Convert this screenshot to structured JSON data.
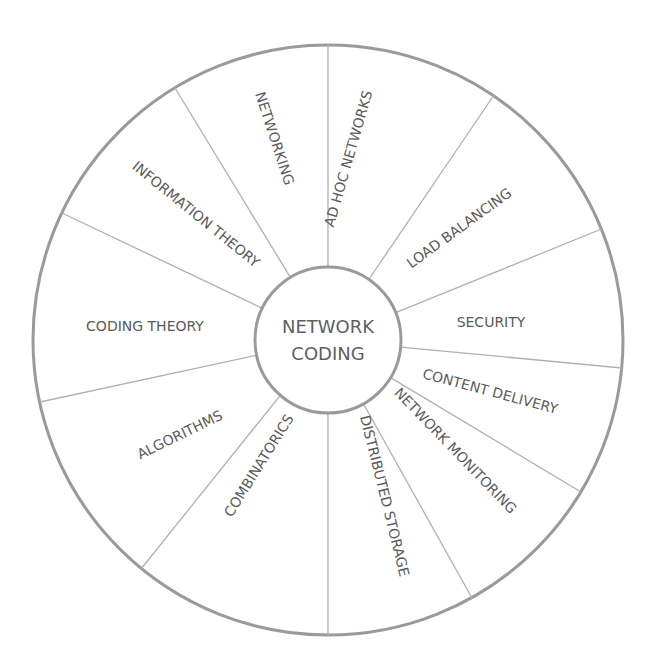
{
  "diagram": {
    "center": {
      "line1": "NETWORK",
      "line2": "CODING"
    },
    "segments": [
      {
        "label": "AD HOC NETWORKS"
      },
      {
        "label": "LOAD BALANCING"
      },
      {
        "label": "SECURITY"
      },
      {
        "label": "CONTENT DELIVERY"
      },
      {
        "label": "NETWORK MONITORING"
      },
      {
        "label": "DISTRIBUTED STORAGE"
      },
      {
        "label": "COMBINATORICS"
      },
      {
        "label": "ALGORITHMS"
      },
      {
        "label": "CODING THEORY"
      },
      {
        "label": "INFORMATION THEORY"
      },
      {
        "label": "NETWORKING"
      }
    ],
    "colors": {
      "outer_ring": "#9a9a9a",
      "spokes": "#b0b0b0",
      "text": "#5a5a5a",
      "background": "#ffffff"
    }
  }
}
